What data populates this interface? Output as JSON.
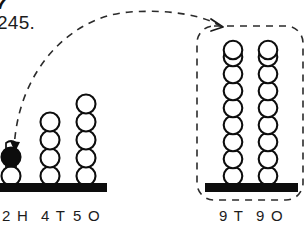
{
  "page": {
    "clipped_header_glyph": "7",
    "problem_number": "245.",
    "background_color": "#ffffff",
    "ink_color": "#0d0d0d",
    "dash_color": "#2b2b2b"
  },
  "left_abacus": {
    "name": "source-abacus",
    "base_bar": {
      "x": 0,
      "y": 183,
      "width": 107,
      "height": 9
    },
    "columns": [
      {
        "id": "hundreds",
        "label": "2 H",
        "label_x": 2,
        "label_y": 208,
        "rod_x": 11,
        "rod_top": 142,
        "beads": [
          {
            "order": 1,
            "fill": "white"
          },
          {
            "order": 2,
            "fill": "black",
            "highlighted": true
          }
        ],
        "bead_count": 2,
        "digit": "2",
        "place": "H"
      },
      {
        "id": "tens",
        "label": "4 T",
        "label_x": 41,
        "label_y": 208,
        "rod_x": 50,
        "rod_top": 112,
        "beads": [
          {
            "order": 1,
            "fill": "white"
          },
          {
            "order": 2,
            "fill": "white"
          },
          {
            "order": 3,
            "fill": "white"
          },
          {
            "order": 4,
            "fill": "white"
          }
        ],
        "bead_count": 4,
        "digit": "4",
        "place": "T"
      },
      {
        "id": "ones",
        "label": "5 O",
        "label_x": 73,
        "label_y": 208,
        "rod_x": 86,
        "rod_top": 95,
        "beads": [
          {
            "order": 1,
            "fill": "white"
          },
          {
            "order": 2,
            "fill": "white"
          },
          {
            "order": 3,
            "fill": "white"
          },
          {
            "order": 4,
            "fill": "white"
          },
          {
            "order": 5,
            "fill": "white"
          }
        ],
        "bead_count": 5,
        "digit": "5",
        "place": "O"
      }
    ]
  },
  "right_abacus": {
    "name": "target-abacus",
    "highlight_box": {
      "x": 197,
      "y": 26,
      "width": 106,
      "height": 174,
      "radius": 17,
      "style": "dashed"
    },
    "base_bar": {
      "x": 205,
      "y": 183,
      "width": 93,
      "height": 9
    },
    "columns": [
      {
        "id": "tens",
        "label": "9 T",
        "label_x": 219,
        "label_y": 208,
        "rod_x": 233,
        "rod_top": 40,
        "bead_count": 9,
        "digit": "9",
        "place": "T"
      },
      {
        "id": "ones",
        "label": "9 O",
        "label_x": 256,
        "label_y": 208,
        "rod_x": 268,
        "rod_top": 40,
        "bead_count": 9,
        "digit": "9",
        "place": "O"
      }
    ]
  },
  "annotation": {
    "curved_arrow": {
      "name": "transfer-arrow",
      "style": "dashed",
      "start": {
        "x": 14,
        "y": 152
      },
      "end": {
        "x": 222,
        "y": 27
      },
      "direction": "left-to-right-arc",
      "arrowhead_start": true,
      "arrowhead_end": true
    }
  }
}
